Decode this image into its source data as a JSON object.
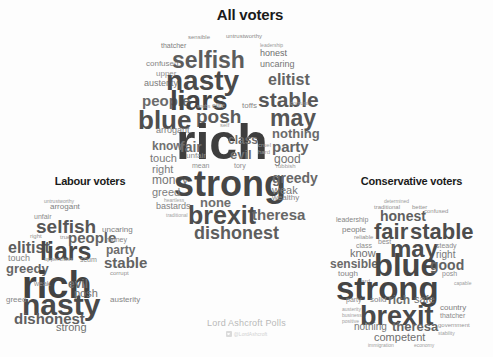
{
  "meta": {
    "background_color": "#fdfdfd",
    "text_color_dark": "#3a3a3a",
    "title_color": "#1a1a1a"
  },
  "credit": {
    "source": "Lord Ashcroft Polls",
    "handle": "@LordAshcroft",
    "twitter_icon": "twitter-icon"
  },
  "panels": {
    "all": {
      "title": "All voters",
      "words": [
        {
          "t": "sensible",
          "x": 38,
          "y": 12,
          "s": 6,
          "c": "#8c8c8c",
          "w": "t4"
        },
        {
          "t": "untrustworthy",
          "x": 76,
          "y": 11,
          "s": 6,
          "c": "#8a8a8a",
          "w": "t4"
        },
        {
          "t": "thatcher",
          "x": 11,
          "y": 20,
          "s": 7,
          "c": "#7d7d7d",
          "w": "t4"
        },
        {
          "t": "leadership",
          "x": 110,
          "y": 20,
          "s": 5,
          "c": "#9a9a9a",
          "w": "t5"
        },
        {
          "t": "honest",
          "x": 110,
          "y": 27,
          "s": 9,
          "c": "#6e6e6e",
          "w": "t4"
        },
        {
          "t": "confused",
          "x": -4,
          "y": 38,
          "s": 8,
          "c": "#868686",
          "w": "t4"
        },
        {
          "t": "selfish",
          "x": 22,
          "y": 28,
          "s": 23,
          "c": "#5c5c5c",
          "w": "t2"
        },
        {
          "t": "uncaring",
          "x": 110,
          "y": 38,
          "s": 9,
          "c": "#757575",
          "w": "t4"
        },
        {
          "t": "upper",
          "x": 6,
          "y": 48,
          "s": 8,
          "c": "#8f8f8f",
          "w": "t4"
        },
        {
          "t": "austerity",
          "x": -6,
          "y": 57,
          "s": 9,
          "c": "#7a7a7a",
          "w": "t4"
        },
        {
          "t": "nasty",
          "x": 16,
          "y": 46,
          "s": 28,
          "c": "#4a4a4a",
          "w": "t1"
        },
        {
          "t": "elitist",
          "x": 118,
          "y": 50,
          "s": 16,
          "c": "#636363",
          "w": "t3"
        },
        {
          "t": "people",
          "x": -8,
          "y": 72,
          "s": 15,
          "c": "#6a6a6a",
          "w": "t3"
        },
        {
          "t": "liars",
          "x": 20,
          "y": 66,
          "s": 28,
          "c": "#434343",
          "w": "t1"
        },
        {
          "t": "stable",
          "x": 108,
          "y": 68,
          "s": 21,
          "c": "#575757",
          "w": "t2"
        },
        {
          "t": "snobs",
          "x": 47,
          "y": 81,
          "s": 5,
          "c": "#9e9e9e",
          "w": "t5"
        },
        {
          "t": "toffs",
          "x": 92,
          "y": 80,
          "s": 8,
          "c": "#878787",
          "w": "t4"
        },
        {
          "t": "elite",
          "x": 62,
          "y": 80,
          "s": 7,
          "c": "#8d8d8d",
          "w": "t4"
        },
        {
          "t": "corrupt",
          "x": 140,
          "y": 78,
          "s": 6,
          "c": "#939393",
          "w": "t5"
        },
        {
          "t": "blue",
          "x": -12,
          "y": 86,
          "s": 26,
          "c": "#4e4e4e",
          "w": "t1"
        },
        {
          "t": "posh",
          "x": 46,
          "y": 86,
          "s": 19,
          "c": "#5b5b5b",
          "w": "t2"
        },
        {
          "t": "may",
          "x": 120,
          "y": 86,
          "s": 23,
          "c": "#565656",
          "w": "t2"
        },
        {
          "t": "arrogant",
          "x": 6,
          "y": 104,
          "s": 9,
          "c": "#7f7f7f",
          "w": "t4"
        },
        {
          "t": "self",
          "x": 70,
          "y": 100,
          "s": 6,
          "c": "#9b9b9b",
          "w": "t5"
        },
        {
          "t": "rich",
          "x": 26,
          "y": 98,
          "s": 50,
          "c": "#3e3e3e",
          "w": "t1"
        },
        {
          "t": "nothing",
          "x": 122,
          "y": 105,
          "s": 13,
          "c": "#6b6b6b",
          "w": "t3"
        },
        {
          "t": "know",
          "x": 2,
          "y": 118,
          "s": 12,
          "c": "#717171",
          "w": "t3"
        },
        {
          "t": "fair",
          "x": 30,
          "y": 118,
          "s": 14,
          "c": "#6d6d6d",
          "w": "t3"
        },
        {
          "t": "class",
          "x": 78,
          "y": 112,
          "s": 12,
          "c": "#6f6f6f",
          "w": "t3"
        },
        {
          "t": "party",
          "x": 122,
          "y": 118,
          "s": 15,
          "c": "#656565",
          "w": "t3"
        },
        {
          "t": "touch",
          "x": 0,
          "y": 131,
          "s": 11,
          "c": "#787878",
          "w": "t4"
        },
        {
          "t": "unfair",
          "x": 36,
          "y": 130,
          "s": 8,
          "c": "#8b8b8b",
          "w": "t4"
        },
        {
          "t": "evil",
          "x": 80,
          "y": 126,
          "s": 13,
          "c": "#6c6c6c",
          "w": "t3"
        },
        {
          "t": "cruel",
          "x": 108,
          "y": 120,
          "s": 6,
          "c": "#9c9c9c",
          "w": "t5"
        },
        {
          "t": "hard",
          "x": 108,
          "y": 127,
          "s": 6,
          "c": "#9c9c9c",
          "w": "t5"
        },
        {
          "t": "good",
          "x": 124,
          "y": 131,
          "s": 12,
          "c": "#717171",
          "w": "t4"
        },
        {
          "t": "right",
          "x": 2,
          "y": 142,
          "s": 11,
          "c": "#7b7b7b",
          "w": "t4"
        },
        {
          "t": "mean",
          "x": 42,
          "y": 140,
          "s": 7,
          "c": "#8f8f8f",
          "w": "t5"
        },
        {
          "t": "tory",
          "x": 84,
          "y": 140,
          "s": 7,
          "c": "#8f8f8f",
          "w": "t5"
        },
        {
          "t": "rubbish",
          "x": 126,
          "y": 141,
          "s": 6,
          "c": "#9a9a9a",
          "w": "t5"
        },
        {
          "t": "money",
          "x": 2,
          "y": 152,
          "s": 12,
          "c": "#757575",
          "w": "t4"
        },
        {
          "t": "strong",
          "x": 24,
          "y": 146,
          "s": 36,
          "c": "#464646",
          "w": "t1"
        },
        {
          "t": "greedy",
          "x": 122,
          "y": 149,
          "s": 14,
          "c": "#686868",
          "w": "t3"
        },
        {
          "t": "greed",
          "x": 2,
          "y": 165,
          "s": 11,
          "c": "#7d7d7d",
          "w": "t4"
        },
        {
          "t": "weak",
          "x": 122,
          "y": 163,
          "s": 11,
          "c": "#777777",
          "w": "t4"
        },
        {
          "t": "heartless",
          "x": 14,
          "y": 175,
          "s": 5,
          "c": "#a2a2a2",
          "w": "t5"
        },
        {
          "t": "wealthy",
          "x": 122,
          "y": 172,
          "s": 8,
          "c": "#898989",
          "w": "t4"
        },
        {
          "t": "bastards",
          "x": 6,
          "y": 180,
          "s": 9,
          "c": "#818181",
          "w": "t4"
        },
        {
          "t": "none",
          "x": 50,
          "y": 174,
          "s": 13,
          "c": "#6e6e6e",
          "w": "t3"
        },
        {
          "t": "traditional",
          "x": 16,
          "y": 190,
          "s": 5,
          "c": "#a4a4a4",
          "w": "t5"
        },
        {
          "t": "brexit",
          "x": 38,
          "y": 182,
          "s": 25,
          "c": "#4d4d4d",
          "w": "t1"
        },
        {
          "t": "theresa",
          "x": 102,
          "y": 186,
          "s": 15,
          "c": "#676767",
          "w": "t3"
        },
        {
          "t": "dishonest",
          "x": 44,
          "y": 203,
          "s": 18,
          "c": "#5e5e5e",
          "w": "t2"
        }
      ]
    },
    "labour": {
      "title": "Labour voters",
      "words": [
        {
          "t": "untrustworthy",
          "x": 38,
          "y": 12,
          "s": 5,
          "c": "#969696",
          "w": "t5"
        },
        {
          "t": "arrogant",
          "x": 44,
          "y": 17,
          "s": 8,
          "c": "#808080",
          "w": "t4"
        },
        {
          "t": "unfair",
          "x": 28,
          "y": 27,
          "s": 7,
          "c": "#8b8b8b",
          "w": "t4"
        },
        {
          "t": "selfish",
          "x": 30,
          "y": 32,
          "s": 19,
          "c": "#565656",
          "w": "t2"
        },
        {
          "t": "uncaring",
          "x": 96,
          "y": 40,
          "s": 8,
          "c": "#7e7e7e",
          "w": "t4"
        },
        {
          "t": "right",
          "x": 24,
          "y": 47,
          "s": 6,
          "c": "#949494",
          "w": "t5"
        },
        {
          "t": "true",
          "x": 54,
          "y": 48,
          "s": 6,
          "c": "#949494",
          "w": "t5"
        },
        {
          "t": "people",
          "x": 62,
          "y": 45,
          "s": 15,
          "c": "#636363",
          "w": "t3"
        },
        {
          "t": "money",
          "x": 100,
          "y": 50,
          "s": 7,
          "c": "#888888",
          "w": "t4"
        },
        {
          "t": "elitist",
          "x": 2,
          "y": 54,
          "s": 16,
          "c": "#5d5d5d",
          "w": "t3"
        },
        {
          "t": "liars",
          "x": 34,
          "y": 54,
          "s": 25,
          "c": "#474747",
          "w": "t1"
        },
        {
          "t": "party",
          "x": 100,
          "y": 58,
          "s": 12,
          "c": "#6e6e6e",
          "w": "t3"
        },
        {
          "t": "touch",
          "x": 2,
          "y": 68,
          "s": 9,
          "c": "#838383",
          "w": "t4"
        },
        {
          "t": "upperclass",
          "x": 38,
          "y": 70,
          "s": 6,
          "c": "#949494",
          "w": "t5"
        },
        {
          "t": "scum",
          "x": 74,
          "y": 70,
          "s": 7,
          "c": "#8c8c8c",
          "w": "t4"
        },
        {
          "t": "greedy",
          "x": 0,
          "y": 76,
          "s": 13,
          "c": "#676767",
          "w": "t3"
        },
        {
          "t": "stable",
          "x": 98,
          "y": 70,
          "s": 15,
          "c": "#636363",
          "w": "t3"
        },
        {
          "t": "corrupt",
          "x": 104,
          "y": 84,
          "s": 6,
          "c": "#939393",
          "w": "t5"
        },
        {
          "t": "rich",
          "x": 16,
          "y": 82,
          "s": 38,
          "c": "#424242",
          "w": "t1"
        },
        {
          "t": "weak",
          "x": 28,
          "y": 94,
          "s": 7,
          "c": "#8d8d8d",
          "w": "t4"
        },
        {
          "t": "evil",
          "x": 62,
          "y": 92,
          "s": 12,
          "c": "#6d6d6d",
          "w": "t3"
        },
        {
          "t": "posh",
          "x": 68,
          "y": 102,
          "s": 11,
          "c": "#727272",
          "w": "t4"
        },
        {
          "t": "nasty",
          "x": 16,
          "y": 105,
          "s": 30,
          "c": "#4a4a4a",
          "w": "t1"
        },
        {
          "t": "greed",
          "x": 0,
          "y": 110,
          "s": 8,
          "c": "#868686",
          "w": "t4"
        },
        {
          "t": "austerity",
          "x": 104,
          "y": 110,
          "s": 8,
          "c": "#858585",
          "w": "t4"
        },
        {
          "t": "dishonest",
          "x": 8,
          "y": 126,
          "s": 15,
          "c": "#606060",
          "w": "t3"
        },
        {
          "t": "strong",
          "x": 50,
          "y": 136,
          "s": 11,
          "c": "#6f6f6f",
          "w": "t4"
        }
      ]
    },
    "conservative": {
      "title": "Conservative voters",
      "words": [
        {
          "t": "determined",
          "x": 54,
          "y": 12,
          "s": 5,
          "c": "#9b9b9b",
          "w": "t5"
        },
        {
          "t": "traditional",
          "x": 44,
          "y": 18,
          "s": 6,
          "c": "#919191",
          "w": "t5"
        },
        {
          "t": "better",
          "x": 82,
          "y": 18,
          "s": 6,
          "c": "#919191",
          "w": "t5"
        },
        {
          "t": "honest",
          "x": 50,
          "y": 23,
          "s": 14,
          "c": "#5f5f5f",
          "w": "t3"
        },
        {
          "t": "confused",
          "x": 94,
          "y": 22,
          "s": 6,
          "c": "#949494",
          "w": "t5"
        },
        {
          "t": "leadership",
          "x": 6,
          "y": 30,
          "s": 7,
          "c": "#858585",
          "w": "t4"
        },
        {
          "t": "people",
          "x": 12,
          "y": 40,
          "s": 8,
          "c": "#7f7f7f",
          "w": "t4"
        },
        {
          "t": "reliable",
          "x": 24,
          "y": 48,
          "s": 6,
          "c": "#909090",
          "w": "t5"
        },
        {
          "t": "fair",
          "x": 44,
          "y": 36,
          "s": 22,
          "c": "#4e4e4e",
          "w": "t1"
        },
        {
          "t": "stable",
          "x": 80,
          "y": 36,
          "s": 22,
          "c": "#4d4d4d",
          "w": "t1"
        },
        {
          "t": "best",
          "x": 48,
          "y": 52,
          "s": 7,
          "c": "#8b8b8b",
          "w": "t4"
        },
        {
          "t": "class",
          "x": 26,
          "y": 56,
          "s": 7,
          "c": "#8a8a8a",
          "w": "t4"
        },
        {
          "t": "know",
          "x": 20,
          "y": 62,
          "s": 11,
          "c": "#707070",
          "w": "t4"
        },
        {
          "t": "may",
          "x": 60,
          "y": 52,
          "s": 24,
          "c": "#4c4c4c",
          "w": "t1"
        },
        {
          "t": "steady",
          "x": 106,
          "y": 56,
          "s": 7,
          "c": "#8c8c8c",
          "w": "t4"
        },
        {
          "t": "right",
          "x": 106,
          "y": 64,
          "s": 10,
          "c": "#787878",
          "w": "t4"
        },
        {
          "t": "sensible",
          "x": 0,
          "y": 72,
          "s": 12,
          "c": "#6a6a6a",
          "w": "t3"
        },
        {
          "t": "blue",
          "x": 44,
          "y": 66,
          "s": 31,
          "c": "#464646",
          "w": "t1"
        },
        {
          "t": "good",
          "x": 100,
          "y": 72,
          "s": 14,
          "c": "#636363",
          "w": "t3"
        },
        {
          "t": "tough",
          "x": 8,
          "y": 84,
          "s": 8,
          "c": "#848484",
          "w": "t4"
        },
        {
          "t": "posh",
          "x": 112,
          "y": 84,
          "s": 7,
          "c": "#8d8d8d",
          "w": "t4"
        },
        {
          "t": "hard",
          "x": 28,
          "y": 92,
          "s": 6,
          "c": "#959595",
          "w": "t5"
        },
        {
          "t": "strong",
          "x": 6,
          "y": 88,
          "s": 33,
          "c": "#444444",
          "w": "t1"
        },
        {
          "t": "capable",
          "x": 124,
          "y": 94,
          "s": 5,
          "c": "#9d9d9d",
          "w": "t5"
        },
        {
          "t": "party",
          "x": 16,
          "y": 110,
          "s": 7,
          "c": "#898989",
          "w": "t4"
        },
        {
          "t": "solid",
          "x": 40,
          "y": 110,
          "s": 8,
          "c": "#858585",
          "w": "t4"
        },
        {
          "t": "rich",
          "x": 58,
          "y": 108,
          "s": 12,
          "c": "#6b6b6b",
          "w": "t3"
        },
        {
          "t": "safe",
          "x": 84,
          "y": 108,
          "s": 11,
          "c": "#6f6f6f",
          "w": "t4"
        },
        {
          "t": "austerity",
          "x": 12,
          "y": 120,
          "s": 5,
          "c": "#9e9e9e",
          "w": "t5"
        },
        {
          "t": "business",
          "x": 12,
          "y": 126,
          "s": 5,
          "c": "#9e9e9e",
          "w": "t5"
        },
        {
          "t": "brexit",
          "x": 30,
          "y": 118,
          "s": 27,
          "c": "#4a4a4a",
          "w": "t1"
        },
        {
          "t": "country",
          "x": 110,
          "y": 118,
          "s": 8,
          "c": "#808080",
          "w": "t4"
        },
        {
          "t": "thatcher",
          "x": 110,
          "y": 126,
          "s": 7,
          "c": "#8a8a8a",
          "w": "t4"
        },
        {
          "t": "positive",
          "x": 12,
          "y": 132,
          "s": 5,
          "c": "#9e9e9e",
          "w": "t5"
        },
        {
          "t": "nothing",
          "x": 24,
          "y": 136,
          "s": 10,
          "c": "#777777",
          "w": "t4"
        },
        {
          "t": "theresa",
          "x": 62,
          "y": 134,
          "s": 13,
          "c": "#666666",
          "w": "t3"
        },
        {
          "t": "government",
          "x": 108,
          "y": 136,
          "s": 6,
          "c": "#959595",
          "w": "t5"
        },
        {
          "t": "competent",
          "x": 44,
          "y": 146,
          "s": 11,
          "c": "#6e6e6e",
          "w": "t4"
        },
        {
          "t": "stability",
          "x": 108,
          "y": 144,
          "s": 5,
          "c": "#9e9e9e",
          "w": "t5"
        },
        {
          "t": "immigration",
          "x": 38,
          "y": 156,
          "s": 5,
          "c": "#a0a0a0",
          "w": "t5"
        },
        {
          "t": "economy",
          "x": 84,
          "y": 156,
          "s": 5,
          "c": "#a0a0a0",
          "w": "t5"
        }
      ]
    }
  }
}
